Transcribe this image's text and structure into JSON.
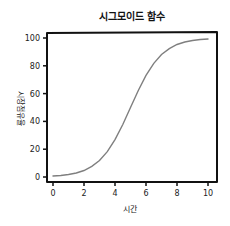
{
  "chart_data": {
    "type": "line",
    "title": "시그모이드 함수",
    "xlabel": "시간",
    "ylabel": "시장점유율",
    "xlim": [
      0,
      10
    ],
    "ylim": [
      0,
      100
    ],
    "xticks": [
      0,
      2,
      4,
      6,
      8,
      10
    ],
    "yticks": [
      0,
      20,
      40,
      60,
      80,
      100
    ],
    "grid": false,
    "legend": null,
    "style": "xkcd",
    "series": [
      {
        "name": "sigmoid",
        "color": "#7f7f7f",
        "x": [
          0,
          0.5,
          1,
          1.5,
          2,
          2.5,
          3,
          3.5,
          4,
          4.5,
          5,
          5.5,
          6,
          6.5,
          7,
          7.5,
          8,
          8.5,
          9,
          9.5,
          10
        ],
        "y": [
          0.7,
          1.1,
          1.8,
          2.9,
          4.7,
          7.6,
          11.9,
          18.2,
          26.9,
          37.8,
          50.0,
          62.2,
          73.1,
          81.8,
          88.1,
          92.4,
          95.3,
          97.1,
          98.2,
          98.9,
          99.3
        ]
      }
    ]
  },
  "colors": {
    "line": "#7f7f7f",
    "axes": "#111111",
    "background": "#ffffff"
  }
}
